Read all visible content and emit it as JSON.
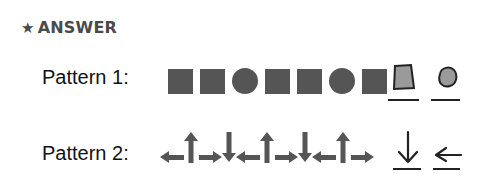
{
  "heading": {
    "icon": "star-icon",
    "text": "ANSWER"
  },
  "patterns": [
    {
      "label": "Pattern 1:",
      "given": [
        "square",
        "square",
        "circle",
        "square",
        "square",
        "circle",
        "square"
      ],
      "answers": [
        "square",
        "circle"
      ]
    },
    {
      "label": "Pattern 2:",
      "given": [
        "left",
        "up",
        "right",
        "down",
        "left",
        "up",
        "right",
        "down",
        "left",
        "up",
        "right"
      ],
      "answers": [
        "down",
        "left"
      ]
    }
  ],
  "colors": {
    "shape_fill": "#555555",
    "answer_fill": "#9a9a9a",
    "ink": "#222222"
  }
}
